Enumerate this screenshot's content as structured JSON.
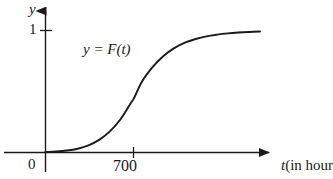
{
  "figure": {
    "background_color": "#ffffff",
    "ink_color": "#1a1a1a",
    "axis_label_y": "y",
    "axis_label_x_variable": "t",
    "axis_label_x_unit": "(in hour",
    "origin_label": "0",
    "y_tick_label": "1",
    "x_tick_label": "700",
    "curve_equation": "y = F(t)"
  },
  "chart_data": {
    "type": "line",
    "title": "",
    "subtitle": "",
    "xlabel": "t (in hour",
    "ylabel": "y",
    "annotations": [
      {
        "text": "y = F(t)",
        "x": 250,
        "y": 0.82,
        "描述": "curve equation label placed above the rising portion of the curve"
      }
    ],
    "legend": null,
    "legend_position": "none",
    "grid": false,
    "xlim": [
      0,
      1700
    ],
    "ylim": [
      0,
      1.12
    ],
    "xticks": [
      700
    ],
    "xtick_labels": [
      "700"
    ],
    "yticks": [
      1
    ],
    "ytick_labels": [
      "1"
    ],
    "origin_label": "0",
    "axis_arrows": {
      "x": true,
      "y": true
    },
    "series": [
      {
        "name": "F(t)",
        "color": "#1a1a1a",
        "linewidth": 1.9,
        "description": "sigmoid cumulative distribution function rising from 0 to asymptote 1, inflection at t = 700",
        "x": [
          0,
          85,
          170,
          255,
          340,
          425,
          510,
          595,
          680,
          700,
          765,
          850,
          935,
          1020,
          1105,
          1190,
          1275,
          1360,
          1445,
          1530,
          1615,
          1700
        ],
        "y": [
          0.0,
          0.004,
          0.012,
          0.027,
          0.055,
          0.1,
          0.17,
          0.27,
          0.41,
          0.44,
          0.58,
          0.7,
          0.79,
          0.855,
          0.9,
          0.93,
          0.952,
          0.966,
          0.976,
          0.983,
          0.988,
          0.992
        ]
      }
    ]
  }
}
